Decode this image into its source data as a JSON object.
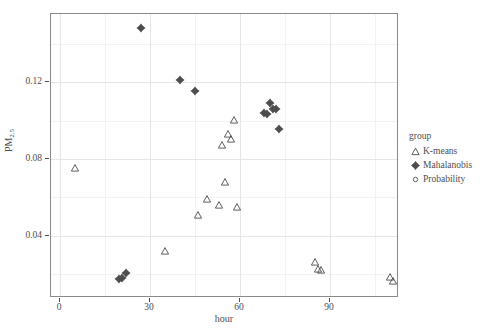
{
  "chart_data": {
    "type": "scatter",
    "title": "",
    "xlabel": "hour",
    "ylabel": "PM2.5",
    "ylabel_base": "PM",
    "ylabel_sub": "2.5",
    "xlim": [
      -3,
      113
    ],
    "ylim": [
      0.0075,
      0.1555
    ],
    "xticks": [
      0,
      30,
      60,
      90
    ],
    "xtick_labels": [
      "0",
      "30",
      "60",
      "90"
    ],
    "yticks": [
      0.04,
      0.08,
      0.12
    ],
    "ytick_labels": [
      "0.04",
      "0.08",
      "0.12"
    ],
    "minor_yticks": [
      0.02,
      0.06,
      0.1,
      0.14
    ],
    "minor_xticks": [
      15,
      45,
      75,
      105
    ],
    "grid": true,
    "legend_position": "right",
    "legend_title": "group",
    "marker_color": "#4d4d4d",
    "panel_border_color": "#8a8a8a",
    "grid_color": "#e6e6e6",
    "series": [
      {
        "name": "K-means",
        "marker": "open-triangle",
        "points": [
          [
            5,
            0.0755
          ],
          [
            35,
            0.032
          ],
          [
            46,
            0.051
          ],
          [
            49,
            0.059
          ],
          [
            53,
            0.056
          ],
          [
            54,
            0.087
          ],
          [
            55,
            0.068
          ],
          [
            56,
            0.093
          ],
          [
            57,
            0.0905
          ],
          [
            58,
            0.1005
          ],
          [
            59,
            0.055
          ],
          [
            85,
            0.0265
          ],
          [
            86,
            0.0225
          ],
          [
            87,
            0.0222
          ],
          [
            110,
            0.0185
          ],
          [
            111,
            0.0163
          ]
        ]
      },
      {
        "name": "Mahalanobis",
        "marker": "filled-diamond-plus",
        "points": [
          [
            27,
            0.148
          ],
          [
            40,
            0.121
          ],
          [
            45,
            0.1155
          ],
          [
            68,
            0.104
          ],
          [
            69,
            0.1035
          ],
          [
            70,
            0.109
          ],
          [
            71,
            0.106
          ],
          [
            72,
            0.106
          ],
          [
            73,
            0.0955
          ],
          [
            19.5,
            0.0175
          ],
          [
            20.5,
            0.0178
          ],
          [
            22.0,
            0.0205
          ]
        ]
      },
      {
        "name": "Probability",
        "marker": "open-circle",
        "points": []
      }
    ]
  },
  "legend": {
    "title": "group",
    "items": [
      {
        "label": "K-means",
        "marker": "open-triangle"
      },
      {
        "label": "Mahalanobis",
        "marker": "filled-diamond-plus"
      },
      {
        "label": "Probability",
        "marker": "open-circle"
      }
    ]
  },
  "axes": {
    "x_title": "hour",
    "y_title_base": "PM",
    "y_title_sub": "2.5"
  }
}
